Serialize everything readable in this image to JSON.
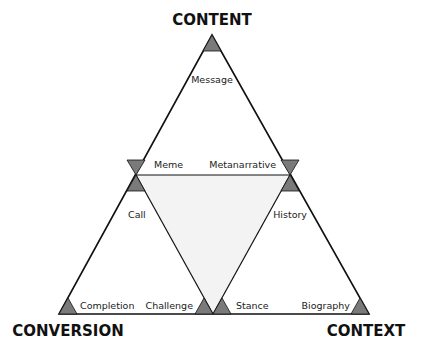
{
  "diagram": {
    "corners": {
      "top": "CONTENT",
      "bottom_left": "CONVERSION",
      "bottom_right": "CONTEXT"
    },
    "labels": {
      "message": "Message",
      "meme": "Meme",
      "metanarrative": "Metanarrative",
      "call": "Call",
      "history": "History",
      "completion": "Completion",
      "challenge": "Challenge",
      "stance": "Stance",
      "biography": "Biography"
    },
    "colors": {
      "line": "#111111",
      "marker_fill": "#7a7a7a",
      "inner_fill": "#f3f3f3",
      "background": "#ffffff"
    }
  }
}
